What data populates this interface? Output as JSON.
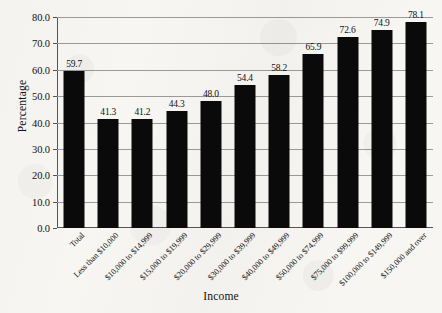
{
  "chart_data": {
    "type": "bar",
    "title": "",
    "xlabel": "Income",
    "ylabel": "Percentage",
    "ylim": [
      0,
      80
    ],
    "ytick_step": 10,
    "grid": true,
    "legend": false,
    "bar_color": "#0a0a0a",
    "background_color": "#f7f6f3",
    "ytick_labels": [
      "0.0",
      "10.0",
      "20.0",
      "30.0",
      "40.0",
      "50.0",
      "60.0",
      "70.0",
      "80.0"
    ],
    "ytick_values": [
      0,
      10,
      20,
      30,
      40,
      50,
      60,
      70,
      80
    ],
    "categories": [
      "Total",
      "Less than $10,000",
      "$10,000 to $14,999",
      "$15,000 to $19,999",
      "$20,000 to $29,999",
      "$30,000 to $39,999",
      "$40,000 to $49,999",
      "$50,000 to $74,999",
      "$75,000 to $99,999",
      "$100,000 to $149,999",
      "$150,000 and over"
    ],
    "values": [
      59.7,
      41.3,
      41.2,
      44.3,
      48.0,
      54.4,
      58.2,
      65.9,
      72.6,
      74.9,
      78.1
    ],
    "value_labels": [
      "59.7",
      "41.3",
      "41.2",
      "44.3",
      "48.0",
      "54.4",
      "58.2",
      "65.9",
      "72.6",
      "74.9",
      "78.1"
    ]
  }
}
